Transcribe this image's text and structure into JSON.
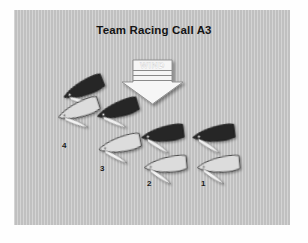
{
  "page": {
    "title": "Team Racing Call A3",
    "background_color": "#ffffff",
    "panel_color": "#c2c2c2"
  },
  "wind": {
    "label": "WIND",
    "direction": "down",
    "arrow_fill": "#f4f4f4",
    "arrow_stroke": "#7a7a7a",
    "label_color": "#ffffff"
  },
  "legend": {
    "dark_team_color": "#262626",
    "light_team_color": "#d7d7d7",
    "sail_color": "#ededed",
    "outline_color": "#2b2b2b"
  },
  "boats": [
    {
      "id": "dark-1",
      "team": "dark",
      "label": "",
      "x": 62,
      "y": 93,
      "rot": -22
    },
    {
      "id": "light-4",
      "team": "light",
      "label": "4",
      "x": 57,
      "y": 112,
      "rot": -18
    },
    {
      "id": "dark-2",
      "team": "dark",
      "label": "",
      "x": 94,
      "y": 113,
      "rot": -14
    },
    {
      "id": "light-3",
      "team": "light",
      "label": "3",
      "x": 95,
      "y": 143,
      "rot": -10
    },
    {
      "id": "dark-3",
      "team": "dark",
      "label": "",
      "x": 137,
      "y": 133,
      "rot": -6
    },
    {
      "id": "light-2",
      "team": "light",
      "label": "2",
      "x": 140,
      "y": 163,
      "rot": -4
    },
    {
      "id": "dark-4",
      "team": "dark",
      "label": "",
      "x": 187,
      "y": 133,
      "rot": -6
    },
    {
      "id": "light-1",
      "team": "light",
      "label": "1",
      "x": 192,
      "y": 163,
      "rot": -4
    }
  ],
  "labels": [
    {
      "text": "4",
      "x": 62,
      "y": 143
    },
    {
      "text": "3",
      "x": 100,
      "y": 166
    },
    {
      "text": "2",
      "x": 146,
      "y": 180
    },
    {
      "text": "1",
      "x": 200,
      "y": 180
    }
  ]
}
